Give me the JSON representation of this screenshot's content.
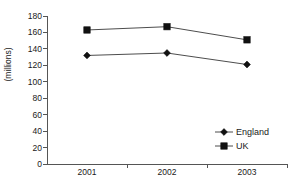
{
  "chart_data": {
    "type": "line",
    "title": "",
    "xlabel": "",
    "ylabel": "(millions)",
    "categories": [
      "2001",
      "2002",
      "2003"
    ],
    "series": [
      {
        "name": "England",
        "marker": "diamond",
        "values": [
          132,
          135,
          121
        ]
      },
      {
        "name": "UK",
        "marker": "square",
        "values": [
          163,
          167,
          151
        ]
      }
    ],
    "ylim": [
      0,
      180
    ],
    "ytick_labels": [
      "180",
      "160",
      "140",
      "120",
      "100",
      "80",
      "60",
      "40",
      "20",
      "0"
    ],
    "ytick_values": [
      180,
      160,
      140,
      120,
      100,
      80,
      60,
      40,
      20,
      0
    ],
    "grid": false,
    "legend_position": "inside-bottom-right",
    "colors": {
      "line": "#4d4d4d",
      "marker": "#111111",
      "axis": "#555555",
      "text": "#1a1a1a",
      "background": "#ffffff"
    }
  },
  "legend": {
    "entries": [
      {
        "label": "England",
        "marker": "diamond-marker-icon"
      },
      {
        "label": "UK",
        "marker": "square-marker-icon"
      }
    ]
  }
}
